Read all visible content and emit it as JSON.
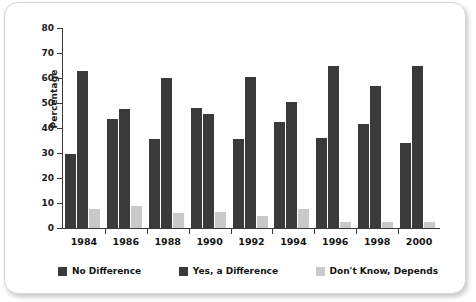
{
  "chart_data": {
    "type": "bar",
    "title": "",
    "xlabel": "",
    "ylabel": "Percentage",
    "ylim": [
      0,
      80
    ],
    "yticks": [
      0,
      10,
      20,
      30,
      40,
      50,
      60,
      70,
      80
    ],
    "grid": false,
    "legend_position": "bottom",
    "categories": [
      "1984",
      "1986",
      "1988",
      "1990",
      "1992",
      "1994",
      "1996",
      "1998",
      "2000"
    ],
    "series": [
      {
        "name": "No Difference",
        "color": "#3a3a3a",
        "values": [
          29.5,
          43.5,
          35.5,
          48,
          35.5,
          42.5,
          36,
          41.5,
          34
        ]
      },
      {
        "name": "Yes, a Difference",
        "color": "#3a3a3a",
        "values": [
          63,
          47.5,
          60,
          45.5,
          60.5,
          50.5,
          65,
          57,
          65
        ]
      },
      {
        "name": "Don't Know, Depends",
        "color": "#c9c9c9",
        "values": [
          7.5,
          9,
          6,
          6.5,
          5,
          7.5,
          2.5,
          2.5,
          2.5
        ]
      }
    ]
  },
  "colors": {
    "dark": "#3a3a3a",
    "light": "#c9c9c9",
    "axis": "#3a3a3a",
    "text": "#141414",
    "card_border": "#d6d6d6",
    "background": "#ffffff"
  }
}
